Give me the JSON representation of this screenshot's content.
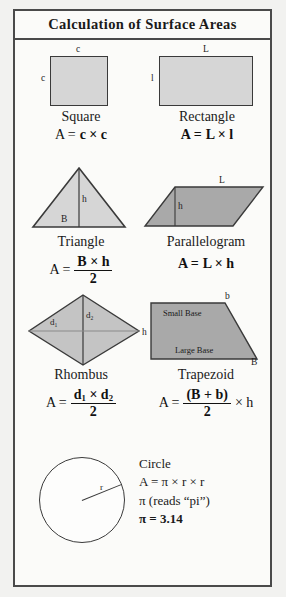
{
  "title": "Calculation of Surface Areas",
  "shapes": [
    {
      "key": "square",
      "name": "Square",
      "dims": {
        "top": "c",
        "left": "c"
      },
      "formula_lhs": "A =",
      "formula_body": "c × c"
    },
    {
      "key": "rectangle",
      "name": "Rectangle",
      "dims": {
        "top": "L",
        "left": "l"
      },
      "formula_lhs": "A =",
      "formula_body": "L × l"
    },
    {
      "key": "triangle",
      "name": "Triangle",
      "dims": {
        "height": "h",
        "base": "B"
      },
      "formula_lhs": "A =",
      "numerator": "B × h",
      "denominator": "2"
    },
    {
      "key": "parallelogram",
      "name": "Parallelogram",
      "dims": {
        "top": "L",
        "height": "h"
      },
      "formula_lhs": "A =",
      "formula_body": "L × h"
    },
    {
      "key": "rhombus",
      "name": "Rhombus",
      "dims": {
        "diagonal1": "d",
        "diagonal1_sub": "1",
        "diagonal2": "d",
        "diagonal2_sub": "2"
      },
      "formula_lhs": "A =",
      "numerator_a": "d",
      "numerator_a_sub": "1",
      "numerator_mid": " × ",
      "numerator_b": "d",
      "numerator_b_sub": "2",
      "denominator": "2"
    },
    {
      "key": "trapezoid",
      "name": "Trapezoid",
      "dims": {
        "top_right": "b",
        "bottom_right": "B",
        "height": "h",
        "small_base": "Small Base",
        "large_base": "Large Base"
      },
      "formula_lhs": "A =",
      "numerator": "(B + b)",
      "denominator": "2",
      "formula_tail": "× h"
    }
  ],
  "circle": {
    "name": "Circle",
    "radius_label": "r",
    "lines": [
      "A = π × r × r",
      "π (reads “pi”)",
      "π = 3.14"
    ]
  },
  "colors": {
    "shape_fill_light": "#d6d6d6",
    "shape_fill_mid": "#a9a9a9",
    "stroke": "#3a3a3a",
    "frame": "#4a4a4a",
    "paper": "#fbfbf9"
  }
}
